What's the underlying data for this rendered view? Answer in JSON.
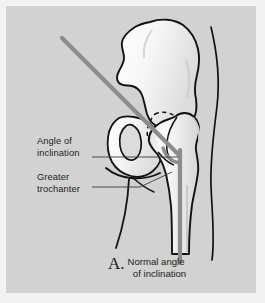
{
  "figure": {
    "background_color": "#d2d2d2",
    "frame_color": "#f2f2f2",
    "bone_fill_color": "#f4f4f4",
    "bone_outline_color": "#121212",
    "angle_line_color": "#8c8c8c",
    "leader_line_color": "#3a3a3a"
  },
  "labels": {
    "angle_of_inclination": "Angle of\ninclination",
    "greater_trochanter": "Greater\ntrochanter"
  },
  "caption": {
    "letter": "A.",
    "text": "Normal angle\n  of inclination"
  },
  "anatomy": {
    "parts": [
      "ilium",
      "acetabulum",
      "obturator-foramen",
      "ischium",
      "pubic-ramus",
      "femoral-head",
      "femoral-neck",
      "greater-trochanter",
      "lesser-trochanter",
      "femoral-shaft",
      "soft-tissue-contour"
    ]
  },
  "angle_markers": {
    "neck_axis_label": "femoral-neck-axis",
    "shaft_axis_label": "femoral-shaft-axis",
    "vertex": "angle-vertex"
  }
}
